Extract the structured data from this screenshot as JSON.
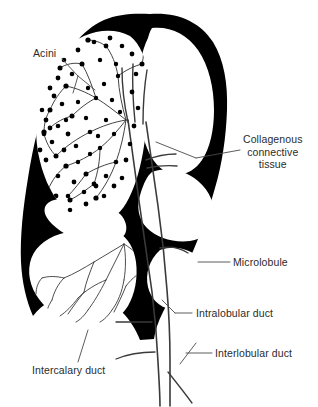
{
  "figure": {
    "background_color": "#ffffff",
    "ink_color": "#000000",
    "text_color": "#2b2b2b",
    "leader_color": "#555555",
    "width": 318,
    "height": 407
  },
  "labels": {
    "acini": "Acini",
    "collagenous_connective_tissue": "Collagenous\nconnective\ntissue",
    "microlobule": "Microlobule",
    "intralobular_duct": "Intralobular duct",
    "interlobular_duct": "Interlobular duct",
    "intercalary_duct": "Intercalary duct"
  },
  "structures": [
    {
      "name": "acinar-lobule-upper-left",
      "fill": "#ffffff",
      "stipple": true
    },
    {
      "name": "lobule-upper-right",
      "fill": "#ffffff",
      "stipple": false
    },
    {
      "name": "lobule-mid-right",
      "fill": "#ffffff",
      "stipple": false
    },
    {
      "name": "lobule-lower-right",
      "fill": "#ffffff",
      "stipple": false
    },
    {
      "name": "lobule-lower-left",
      "fill": "#ffffff",
      "stipple": false
    },
    {
      "name": "collagenous-septa",
      "fill": "#000000",
      "stipple": false
    },
    {
      "name": "duct-trunk",
      "fill": "#ffffff",
      "stipple": false
    }
  ]
}
